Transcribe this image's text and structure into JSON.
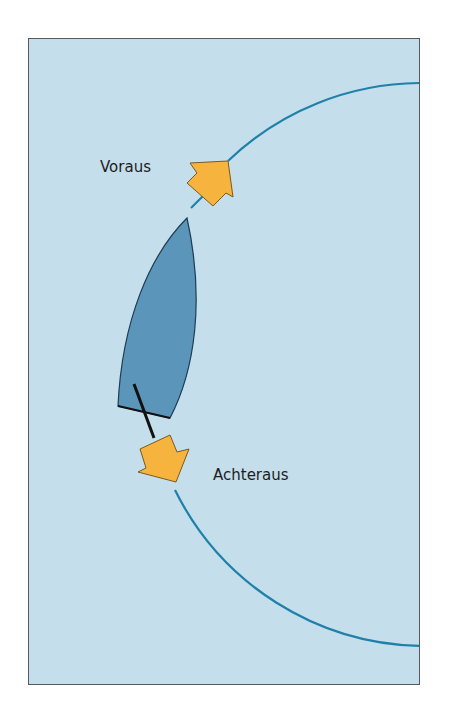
{
  "diagram": {
    "labels": {
      "bow_direction": "Voraus",
      "stern_direction": "Achteraus"
    },
    "colors": {
      "water": "#c4deec",
      "frame_border": "#555a60",
      "arc": "#1f80a8",
      "boat_hull": "#5b95ba",
      "arrow_fill": "#f6b43e",
      "arrow_stroke": "#7a5a1e",
      "tiller": "#111111"
    },
    "elements": [
      {
        "name": "turning-circle-arc",
        "type": "arc",
        "center": [
          422,
          363
        ],
        "radius": 280
      },
      {
        "name": "boat",
        "type": "hull",
        "bow": [
          187,
          218
        ],
        "stern_left": [
          118,
          406
        ],
        "stern_right": [
          170,
          418
        ]
      },
      {
        "name": "tiller",
        "type": "line",
        "from": [
          134,
          384
        ],
        "to": [
          154,
          438
        ]
      },
      {
        "name": "forward-arrow",
        "direction": "ahead",
        "tip": [
          228,
          161
        ]
      },
      {
        "name": "backward-arrow",
        "direction": "astern",
        "tip": [
          176,
          482
        ]
      }
    ]
  }
}
